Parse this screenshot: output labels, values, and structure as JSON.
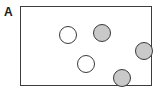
{
  "panel": {
    "label": "A"
  },
  "frame": {
    "x": 20,
    "y": 6,
    "width": 132,
    "height": 80,
    "border_color": "#3d3d3d",
    "background_color": "#ffffff"
  },
  "legend_colors": {
    "open_circle_fill": "#ffffff",
    "filled_circle_fill": "#c9c9c9",
    "outline": "#3a3a3a"
  },
  "chart_data": {
    "type": "scatter",
    "title": "A",
    "xlabel": "",
    "ylabel": "",
    "grid": false,
    "legend_position": "none",
    "xlim": [
      0,
      132
    ],
    "ylim": [
      0,
      80
    ],
    "note": "Panel A: schematic box containing five circular markers; two are open (white fill) and three are shaded (gray fill).",
    "series": [
      {
        "name": "open",
        "fill": "#ffffff",
        "marker": "open-circle",
        "points": [
          {
            "cx": 47,
            "cy": 28,
            "d": 18
          },
          {
            "cx": 65,
            "cy": 57,
            "d": 18
          }
        ]
      },
      {
        "name": "filled",
        "fill": "#c9c9c9",
        "marker": "filled-circle",
        "points": [
          {
            "cx": 81,
            "cy": 26,
            "d": 18
          },
          {
            "cx": 123,
            "cy": 44,
            "d": 18
          },
          {
            "cx": 101,
            "cy": 71,
            "d": 18
          }
        ]
      }
    ],
    "counts": {
      "open": 2,
      "filled": 3,
      "total": 5
    }
  }
}
